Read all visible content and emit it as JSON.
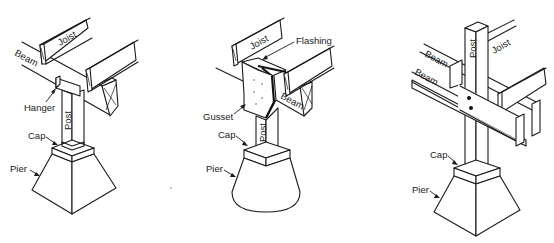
{
  "figures": [
    {
      "id": "hanger-connection",
      "labels": {
        "joist": "Joist",
        "beam": "Beam",
        "hanger": "Hanger",
        "post": "Post",
        "cap": "Cap",
        "pier": "Pier"
      }
    },
    {
      "id": "gusset-connection",
      "labels": {
        "joist": "Joist",
        "flashing": "Flashing",
        "gusset": "Gusset",
        "beam": "Beam",
        "post": "Post",
        "cap": "Cap",
        "pier": "Pier"
      }
    },
    {
      "id": "through-post-connection",
      "labels": {
        "post": "Post",
        "beam_upper": "Beam",
        "beam_lower": "Beam",
        "joist": "Joist",
        "cap": "Cap",
        "pier": "Pier"
      }
    }
  ]
}
